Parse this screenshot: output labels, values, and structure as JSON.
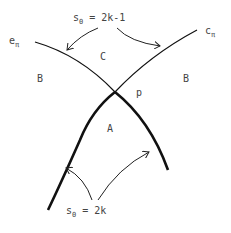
{
  "labels": {
    "top_formula_s": "s",
    "top_formula_sub": "0",
    "top_formula_rest": " = 2k-1",
    "bottom_formula_s": "s",
    "bottom_formula_sub": "0",
    "bottom_formula_rest": " = 2k",
    "e_main": "e",
    "e_sub": "π",
    "c_main": "c",
    "c_sub": "π",
    "region_C": "C",
    "region_B_left": "B",
    "region_B_right": "B",
    "region_A": "A",
    "point_p": "p"
  },
  "colors": {
    "stroke": "#111111",
    "text": "#444444",
    "background": "#ffffff"
  }
}
